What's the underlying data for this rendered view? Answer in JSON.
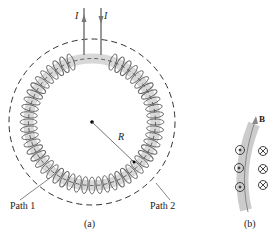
{
  "figure_a": {
    "current_label_left": "I",
    "current_label_right": "I",
    "radius_label": "R",
    "path1_label": "Path 1",
    "path2_label": "Path 2",
    "caption": "(a)"
  },
  "figure_b": {
    "field_label": "B",
    "caption": "(b)",
    "dot_symbols": 3,
    "cross_symbols": 3
  },
  "colors": {
    "coil": "#666666",
    "core": "#d8d8d8",
    "line": "#333333"
  }
}
